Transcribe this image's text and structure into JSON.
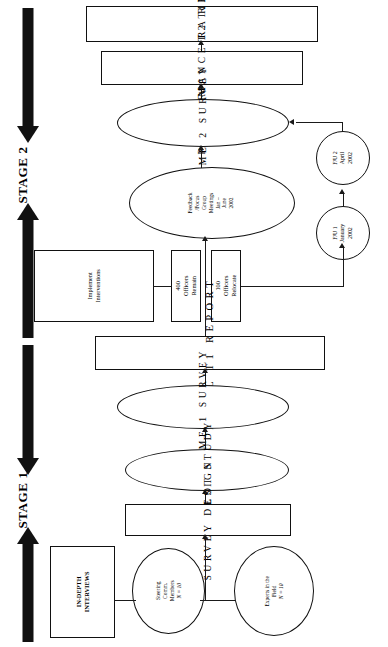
{
  "diagram": {
    "orientation": "rotated-90-counterclockwise",
    "stages": [
      {
        "id": "stage2",
        "label": "STAGE 2"
      },
      {
        "id": "stage1",
        "label": "STAGE 1"
      }
    ],
    "nodes": {
      "final_t2_report": {
        "label": "FINAL T2 REPORT",
        "shape": "rectangle"
      },
      "performance_rating": {
        "label": "PERFORMANCE RATING",
        "shape": "rectangle"
      },
      "time2_survey": {
        "label": "TIME 2 SURVEY",
        "shape": "ellipse"
      },
      "fu2": {
        "line1": "F/U 2",
        "line2": "April",
        "line3": "2002",
        "shape": "circle"
      },
      "fu1": {
        "line1": "F/U 1",
        "line2": "January",
        "line3": "2002",
        "shape": "circle"
      },
      "feedback": {
        "line1": "Feedback",
        "line2": "/Focus",
        "line3": "Group",
        "line4": "Meetings",
        "line5": "Jan –",
        "line6": "June",
        "line7": "2002",
        "shape": "ellipse"
      },
      "implement_interventions": {
        "line1": "Implement",
        "line2": "Interventions",
        "shape": "rectangle"
      },
      "officers_remain": {
        "line1": "400 Officers",
        "line2": "Remain",
        "shape": "rectangle"
      },
      "officers_relocate": {
        "line1": "100 Officers",
        "line2": "Relocate",
        "shape": "rectangle"
      },
      "final_t1_report": {
        "label": "FINAL T1 REPORT",
        "shape": "rectangle"
      },
      "time1_survey": {
        "label": "TIME 1 SURVEY",
        "shape": "ellipse"
      },
      "pilot_study": {
        "label": "PILOT STUDY",
        "shape": "ellipse"
      },
      "survey_design": {
        "label": "SURVEY DESIGN",
        "shape": "rectangle"
      },
      "in_depth_interviews": {
        "line1": "IN-DEPTH",
        "line2": "INTERVIEWS",
        "shape": "rectangle"
      },
      "steering_committee": {
        "line1": "Steering",
        "line2": "Comm.",
        "line3": "Members",
        "line4": "N = 10",
        "shape": "circle"
      },
      "experts_field": {
        "line1": "Experts in the",
        "line2": "Field",
        "line3": "N = 10",
        "shape": "circle"
      }
    },
    "colors": {
      "stroke": "#111111",
      "fill": "#ffffff",
      "text": "#000000"
    }
  }
}
